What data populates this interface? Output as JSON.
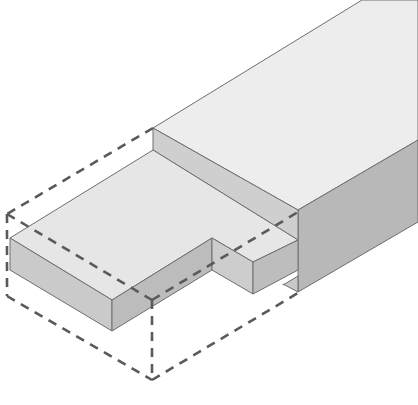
{
  "figure": {
    "colors": {
      "background": "#ffffff",
      "top_face": "#ececec",
      "front_face": "#c9c9c9",
      "side_face": "#b5b5b5",
      "edge": "#6e6e6e",
      "dashed_outline": "#5a5a5a"
    },
    "parts": [
      {
        "name": "beam-top-face",
        "fill": "#ededed"
      },
      {
        "name": "beam-side-face",
        "fill": "#b8b8b8"
      },
      {
        "name": "shoulder-face",
        "fill": "#cfcfcf"
      },
      {
        "name": "tenon-top-face",
        "fill": "#e6e6e6"
      },
      {
        "name": "tenon-front-face",
        "fill": "#c6c6c6"
      },
      {
        "name": "tenon-end-face",
        "fill": "#bcbcbc"
      },
      {
        "name": "notch-faces",
        "fill": "#c2c2c2"
      },
      {
        "name": "removed-stock-outline",
        "style": "dashed"
      }
    ]
  }
}
